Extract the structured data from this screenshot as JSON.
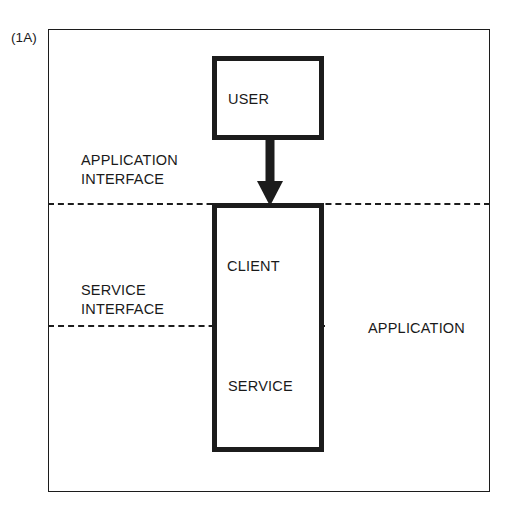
{
  "figure": {
    "number_label": "(1A)",
    "type": "block-diagram"
  },
  "colors": {
    "ink": "#1c1c1c",
    "paper": "#ffffff"
  },
  "nodes": {
    "user": {
      "label": "USER"
    },
    "client": {
      "label": "CLIENT"
    },
    "service": {
      "label": "SERVICE"
    }
  },
  "boundaries": {
    "application_interface": {
      "label": "APPLICATION\nINTERFACE",
      "style": "dashed"
    },
    "service_interface": {
      "label": "SERVICE\nINTERFACE",
      "style": "dashed"
    }
  },
  "frame": {
    "label": "APPLICATION"
  },
  "connector": {
    "from": "USER",
    "to": "CLIENT",
    "name": "down-arrow"
  }
}
